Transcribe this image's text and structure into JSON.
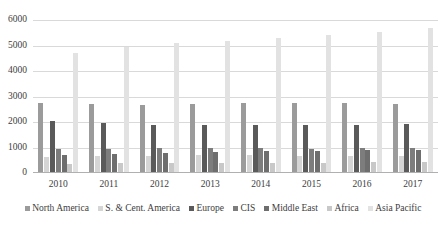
{
  "chart_data": {
    "type": "bar",
    "title": "",
    "xlabel": "",
    "ylabel": "",
    "ylim": [
      0,
      6000
    ],
    "ytick_step": 1000,
    "yticks": [
      "6000",
      "5000",
      "4000",
      "3000",
      "2000",
      "1000",
      "0"
    ],
    "grid": true,
    "legend_position": "bottom",
    "categories": [
      "2010",
      "2011",
      "2012",
      "2013",
      "2014",
      "2015",
      "2016",
      "2017"
    ],
    "series": [
      {
        "name": "North America",
        "color": "#9b9b9b",
        "values": [
          2750,
          2720,
          2680,
          2700,
          2760,
          2730,
          2740,
          2720
        ]
      },
      {
        "name": "S. & Cent. America",
        "color": "#d5d5d5",
        "values": [
          620,
          660,
          680,
          690,
          700,
          680,
          660,
          650
        ]
      },
      {
        "name": "Europe",
        "color": "#5a5a5a",
        "values": [
          2030,
          1960,
          1900,
          1870,
          1880,
          1880,
          1900,
          1930
        ]
      },
      {
        "name": "CIS",
        "color": "#7d7d7d",
        "values": [
          960,
          960,
          970,
          970,
          970,
          960,
          970,
          990
        ]
      },
      {
        "name": "Middle East",
        "color": "#6e6e6e",
        "values": [
          720,
          760,
          800,
          830,
          860,
          880,
          900,
          900
        ]
      },
      {
        "name": "Africa",
        "color": "#c8c8c8",
        "values": [
          370,
          380,
          390,
          390,
          400,
          410,
          420,
          430
        ]
      },
      {
        "name": "Asia Pacific",
        "color": "#e2e2e2",
        "values": [
          4690,
          4960,
          5080,
          5180,
          5300,
          5400,
          5520,
          5670
        ]
      }
    ]
  }
}
